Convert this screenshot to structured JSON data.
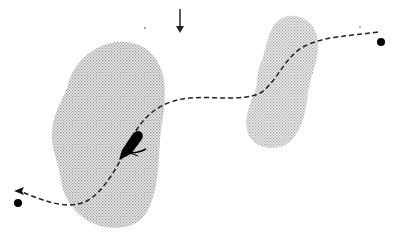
{
  "diagram": {
    "type": "trajectory-sketch",
    "colors": {
      "background": "#ffffff",
      "ink": "#111111",
      "stipple_dot": "#8a8a8a",
      "stipple_fill": "#e4e4e4"
    },
    "direction_arrow": {
      "icon": "down-arrow-icon",
      "x": 180,
      "y1": 10,
      "y2": 32
    },
    "zones": [
      {
        "name": "left-stipple-zone",
        "path": "M118,42 C142,40 160,55 164,80 C167,100 162,120 160,140 C158,170 158,195 145,215 C132,232 105,230 90,222 C72,212 62,195 60,175 C58,160 50,148 52,130 C54,110 64,98 68,85 C72,65 92,44 118,42 Z"
      },
      {
        "name": "right-stipple-zone",
        "path": "M288,16 C308,14 320,30 318,50 C316,68 310,78 308,92 C306,112 302,135 285,145 C270,152 250,146 247,130 C244,116 250,104 255,92 C258,84 256,72 262,60 C268,44 268,20 288,16 Z"
      }
    ],
    "track": {
      "style": "dashed",
      "path": "M378,32 C350,36 325,36 305,46 C285,56 278,80 262,92 C245,102 215,96 190,98 C165,100 145,112 132,138 C120,162 105,192 85,202 C65,210 42,200 22,192",
      "arrowhead": {
        "x": 18,
        "y": 191,
        "direction": "left"
      }
    },
    "endpoints": [
      {
        "name": "start-point",
        "x": 381,
        "y": 42,
        "r": 4
      },
      {
        "name": "end-point",
        "x": 18,
        "y": 203,
        "r": 4
      }
    ],
    "vessel": {
      "icon": "boat-icon",
      "x": 130,
      "y": 146
    },
    "specks": [
      {
        "x": 145,
        "y": 28
      },
      {
        "x": 360,
        "y": 27
      }
    ]
  }
}
